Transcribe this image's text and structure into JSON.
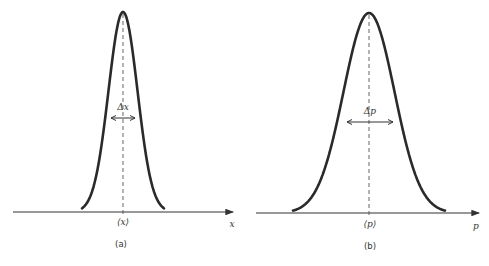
{
  "figure": {
    "panels": [
      {
        "id": "a",
        "caption": "(a)",
        "axis_label": "x",
        "mean_label": "⟨x⟩",
        "width_label": "Δx",
        "distribution": "gaussian",
        "relative_width": "narrow"
      },
      {
        "id": "b",
        "caption": "(b)",
        "axis_label": "p",
        "mean_label": "⟨p⟩",
        "width_label": "Δp",
        "distribution": "gaussian",
        "relative_width": "wide"
      }
    ],
    "colors": {
      "curve": "#2a2a2a",
      "axis": "#333333",
      "background": "#ffffff"
    }
  }
}
